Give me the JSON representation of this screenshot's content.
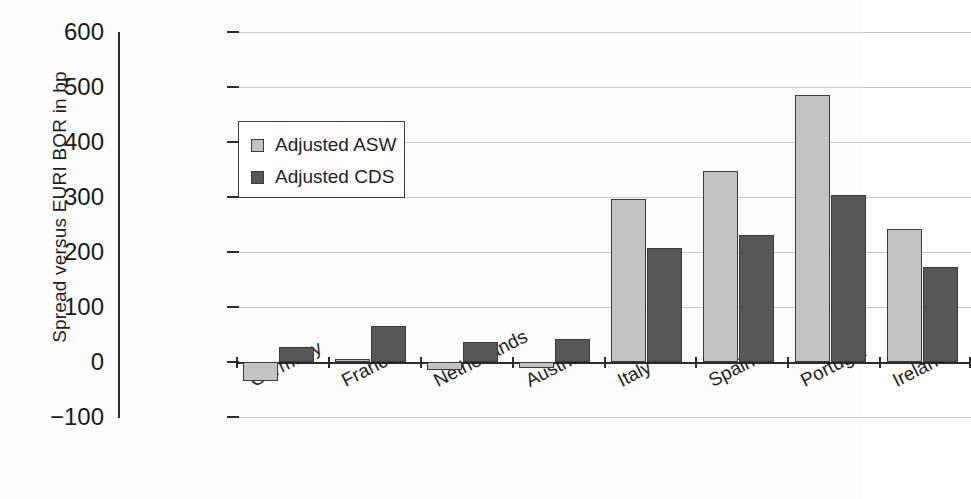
{
  "chart_data": {
    "type": "bar",
    "title": "",
    "subtitle": "",
    "xlabel": "",
    "ylabel": "Spread versus EURI BOR in bp",
    "categories": [
      "Germany",
      "France",
      "Netherlands",
      "Austria",
      "Italy",
      "Spain",
      "Portugal",
      "Ireland"
    ],
    "series": [
      {
        "name": "Adjusted ASW",
        "color": "#c3c3c3",
        "values": [
          -35,
          5,
          -15,
          -10,
          297,
          348,
          485,
          242
        ]
      },
      {
        "name": "Adjusted CDS",
        "color": "#575757",
        "values": [
          28,
          66,
          37,
          42,
          207,
          231,
          303,
          172
        ]
      }
    ],
    "ylim": [
      -100,
      600
    ],
    "yticks": [
      600,
      500,
      400,
      300,
      200,
      100,
      0,
      -100
    ],
    "ytick_labels": [
      "600",
      "500",
      "400",
      "300",
      "200",
      "100",
      "0",
      "−100"
    ],
    "grid": true,
    "grid_axis": "y",
    "legend_position": "upper-left-inside",
    "units": "bp"
  },
  "legend": {
    "items": [
      {
        "label": "Adjusted ASW"
      },
      {
        "label": "Adjusted CDS"
      }
    ]
  },
  "colors": {
    "series_light": "#c3c3c3",
    "series_dark": "#575757",
    "axis": "#2b2b2b",
    "grid": "#c9c9c9",
    "background": "#fdfdfd"
  }
}
